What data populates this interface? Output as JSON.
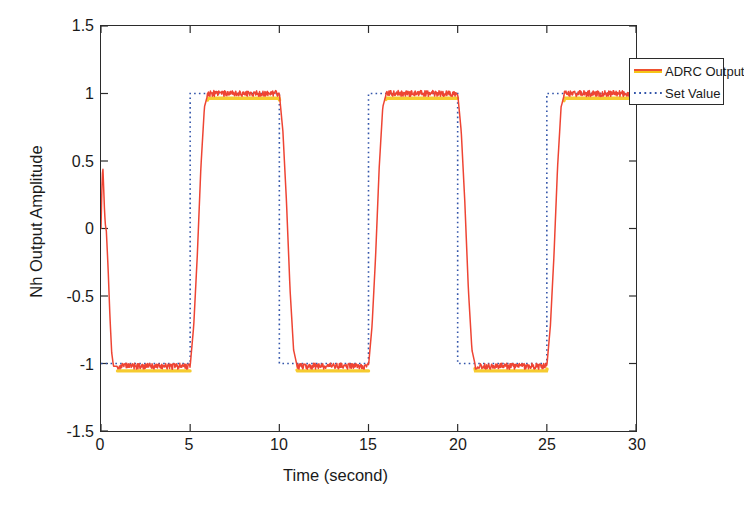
{
  "chart_data": {
    "type": "line",
    "title": "",
    "xlabel": "Time (second)",
    "ylabel": "Nh Output Amplitude",
    "xlim": [
      0,
      30
    ],
    "ylim": [
      -1.5,
      1.5
    ],
    "xticks": [
      0,
      5,
      10,
      15,
      20,
      25,
      30
    ],
    "xtick_labels": [
      "0",
      "5",
      "10",
      "15",
      "20",
      "25",
      "30"
    ],
    "yticks": [
      -1.5,
      -1,
      -0.5,
      0,
      0.5,
      1,
      1.5
    ],
    "ytick_labels": [
      "-1.5",
      "-1",
      "-0.5",
      "0",
      "0.5",
      "1",
      "1.5"
    ],
    "grid": false,
    "legend_position": "upper right",
    "series": [
      {
        "name": "ADRC Output",
        "color": "#ee4433",
        "shadow_color": "#f5c518",
        "style": "solid",
        "description": "ADRC controlled output; initial transient spike to 0.47 at t=0.1 s, settles to -1.02, then tracks the square set value with ~0.55 s slew and small measurement ripple of about +/- 0.02",
        "x": [
          0,
          0.05,
          0.1,
          0.15,
          0.2,
          0.25,
          0.3,
          0.4,
          0.5,
          0.6,
          0.7,
          1,
          2,
          3,
          4,
          5,
          5.2,
          5.4,
          5.6,
          5.8,
          6,
          7,
          8,
          9,
          10,
          10.2,
          10.4,
          10.6,
          10.8,
          11,
          12,
          13,
          14,
          15,
          15.2,
          15.4,
          15.6,
          15.8,
          16,
          17,
          18,
          19,
          20,
          20.2,
          20.4,
          20.6,
          20.8,
          21,
          22,
          23,
          24,
          25,
          25.2,
          25.4,
          25.6,
          25.8,
          26,
          27,
          28,
          29,
          30
        ],
        "y": [
          0,
          0.3,
          0.47,
          0.3,
          0.12,
          0.02,
          -0.02,
          -0.3,
          -0.65,
          -0.92,
          -1.02,
          -1.02,
          -1.02,
          -1.02,
          -1.02,
          -1.02,
          -0.72,
          -0.2,
          0.45,
          0.9,
          1.0,
          1.0,
          1.0,
          1.0,
          1.0,
          0.72,
          0.2,
          -0.45,
          -0.9,
          -1.02,
          -1.02,
          -1.02,
          -1.02,
          -1.02,
          -0.72,
          -0.2,
          0.45,
          0.9,
          1.0,
          1.0,
          1.0,
          1.0,
          1.0,
          0.72,
          0.2,
          -0.45,
          -0.9,
          -1.02,
          -1.02,
          -1.02,
          -1.02,
          -1.02,
          -0.72,
          -0.2,
          0.45,
          0.9,
          1.0,
          1.0,
          1.0,
          1.0,
          1.0
        ],
        "noise_amplitude": 0.022,
        "plateau_high": 1.0,
        "plateau_low": -1.02,
        "initial_overshoot": 0.47
      },
      {
        "name": "Set Value",
        "color": "#3355aa",
        "style": "dotted",
        "description": "Reference square wave, period 10 s, amplitude +/-1, starting low at -1 and stepping high at t=5 s",
        "x": [
          0,
          5,
          5,
          10,
          10,
          15,
          15,
          20,
          20,
          25,
          25,
          30
        ],
        "y": [
          -1,
          -1,
          1,
          1,
          -1,
          -1,
          1,
          1,
          -1,
          -1,
          1,
          1
        ],
        "period": 10,
        "amplitude": 1,
        "first_rising_edge": 5
      }
    ]
  },
  "legend": {
    "entries": [
      {
        "label": "ADRC Output",
        "icon": "solid-line-swatch"
      },
      {
        "label": "Set Value",
        "icon": "dotted-line-swatch"
      }
    ]
  },
  "axes": {
    "x_title": "Time (second)",
    "y_title": "Nh Output Amplitude",
    "x_tick_labels": [
      "0",
      "5",
      "10",
      "15",
      "20",
      "25",
      "30"
    ],
    "y_tick_labels": [
      "1.5",
      "1",
      "0.5",
      "0",
      "-0.5",
      "-1",
      "-1.5"
    ]
  },
  "colors": {
    "adrc_line": "#ee4433",
    "adrc_shadow": "#f5c518",
    "set_value_line": "#3355aa",
    "axis": "#2b2b2b",
    "background": "#ffffff"
  }
}
